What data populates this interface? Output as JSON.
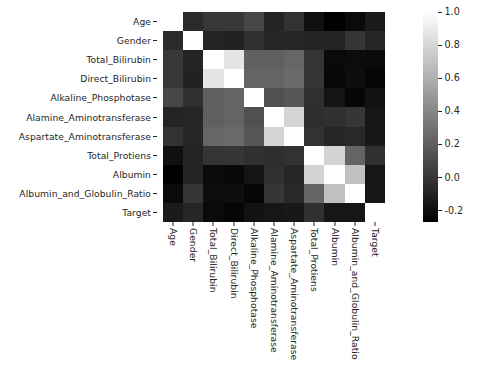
{
  "chart_data": {
    "type": "heatmap",
    "title": "",
    "xlabel": "",
    "ylabel": "",
    "colormap": "gray",
    "grid": false,
    "legend_position": "right",
    "zlim": [
      -0.27,
      1.0
    ],
    "categories": [
      "Age",
      "Gender",
      "Total_Bilirubin",
      "Direct_Bilirubin",
      "Alkaline_Phosphotase",
      "Alamine_Aminotransferase",
      "Aspartate_Aminotransferase",
      "Total_Protiens",
      "Albumin",
      "Albumin_and_Globulin_Ratio",
      "Target"
    ],
    "x_tick_labels": [
      "Age",
      "Gender",
      "Total_Bilirubin",
      "Direct_Bilirubin",
      "Alkaline_Phosphotase",
      "Alamine_Aminotransferase",
      "Aspartate_Aminotransferase",
      "Total_Protiens",
      "Albumin",
      "Albumin_and_Globulin_Ratio",
      "Target"
    ],
    "y_tick_labels": [
      "Age",
      "Gender",
      "Total_Bilirubin",
      "Direct_Bilirubin",
      "Alkaline_Phosphotase",
      "Alamine_Aminotransferase",
      "Aspartate_Aminotransferase",
      "Total_Protiens",
      "Albumin",
      "Albumin_and_Globulin_Ratio",
      "Target"
    ],
    "matrix": [
      [
        1.0,
        -0.06,
        0.01,
        0.01,
        0.08,
        -0.09,
        -0.02,
        -0.19,
        -0.27,
        -0.22,
        -0.14
      ],
      [
        -0.06,
        1.0,
        -0.09,
        -0.1,
        -0.03,
        -0.08,
        -0.08,
        -0.09,
        -0.09,
        -0.0,
        -0.08
      ],
      [
        0.01,
        -0.09,
        1.0,
        0.87,
        0.21,
        0.21,
        0.24,
        -0.01,
        -0.22,
        -0.21,
        -0.22
      ],
      [
        0.01,
        -0.1,
        0.87,
        1.0,
        0.23,
        0.23,
        0.26,
        -0.0,
        -0.23,
        -0.2,
        -0.24
      ],
      [
        0.08,
        -0.03,
        0.21,
        0.23,
        1.0,
        0.13,
        0.16,
        -0.03,
        -0.17,
        -0.24,
        -0.18
      ],
      [
        -0.09,
        -0.08,
        0.21,
        0.23,
        0.13,
        1.0,
        0.79,
        -0.04,
        -0.03,
        -0.0,
        -0.16
      ],
      [
        -0.02,
        -0.08,
        0.24,
        0.26,
        0.16,
        0.79,
        1.0,
        -0.02,
        -0.08,
        -0.07,
        -0.15
      ],
      [
        -0.19,
        -0.09,
        -0.01,
        -0.0,
        -0.03,
        -0.04,
        -0.02,
        1.0,
        0.78,
        0.23,
        -0.03
      ],
      [
        -0.27,
        -0.09,
        -0.22,
        -0.23,
        -0.17,
        -0.03,
        -0.08,
        0.78,
        1.0,
        0.69,
        -0.16
      ],
      [
        -0.22,
        -0.0,
        -0.21,
        -0.2,
        -0.24,
        -0.0,
        -0.07,
        0.23,
        0.69,
        1.0,
        -0.16
      ],
      [
        -0.14,
        -0.08,
        -0.22,
        -0.24,
        -0.18,
        -0.16,
        -0.15,
        -0.03,
        -0.16,
        -0.16,
        1.0
      ]
    ],
    "colorbar": {
      "ticks": [
        "1.0",
        "0.8",
        "0.6",
        "0.4",
        "0.2",
        "0.0",
        "-0.2"
      ],
      "tick_values": [
        1.0,
        0.8,
        0.6,
        0.4,
        0.2,
        0.0,
        -0.2
      ],
      "vmin": -0.27,
      "vmax": 1.0,
      "low_color": "#000000",
      "high_color": "#ffffff"
    }
  }
}
